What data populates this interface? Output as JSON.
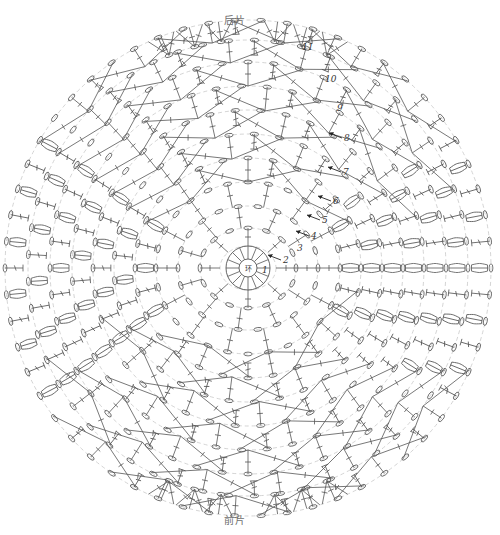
{
  "diagram": {
    "title_top": "后片",
    "title_bottom": "前片",
    "center_label": "环",
    "stroke_color": "#555555",
    "guide_color": "#c9c9c9",
    "background": "#ffffff"
  },
  "round_labels": [
    {
      "id": "1",
      "text": "1",
      "x": 262,
      "y": 265,
      "arrow": false
    },
    {
      "id": "2",
      "text": "2",
      "x": 283,
      "y": 255,
      "arrow": true
    },
    {
      "id": "3",
      "text": "3",
      "x": 297,
      "y": 243,
      "arrow": false
    },
    {
      "id": "4",
      "text": "4",
      "x": 311,
      "y": 231,
      "arrow": true
    },
    {
      "id": "5",
      "text": "5",
      "x": 322,
      "y": 215,
      "arrow": true
    },
    {
      "id": "6",
      "text": "6",
      "x": 333,
      "y": 196,
      "arrow": true
    },
    {
      "id": "7",
      "text": "7",
      "x": 343,
      "y": 167,
      "arrow": true
    },
    {
      "id": "8",
      "text": "8",
      "x": 344,
      "y": 133,
      "arrow": true
    },
    {
      "id": "9",
      "text": "9",
      "x": 337,
      "y": 103,
      "arrow": false
    },
    {
      "id": "10",
      "text": "10",
      "x": 325,
      "y": 74,
      "arrow": false
    },
    {
      "id": "11",
      "text": "11",
      "x": 302,
      "y": 42,
      "arrow": false
    }
  ],
  "guide_ellipses": [
    {
      "rx": 28,
      "ry": 22
    },
    {
      "rx": 48,
      "ry": 40
    },
    {
      "rx": 70,
      "ry": 62
    },
    {
      "rx": 92,
      "ry": 86
    },
    {
      "rx": 113,
      "ry": 110
    },
    {
      "rx": 134,
      "ry": 134
    },
    {
      "rx": 155,
      "ry": 158
    },
    {
      "rx": 176,
      "ry": 182
    },
    {
      "rx": 198,
      "ry": 206
    },
    {
      "rx": 220,
      "ry": 228
    },
    {
      "rx": 243,
      "ry": 248
    }
  ],
  "chart_data": {
    "type": "diagram",
    "center": {
      "x": 248,
      "y": 268
    },
    "rounds": 11,
    "symbols": {
      "chain": "oval",
      "double_crochet": "vertical-bar",
      "cluster": "fan"
    }
  }
}
